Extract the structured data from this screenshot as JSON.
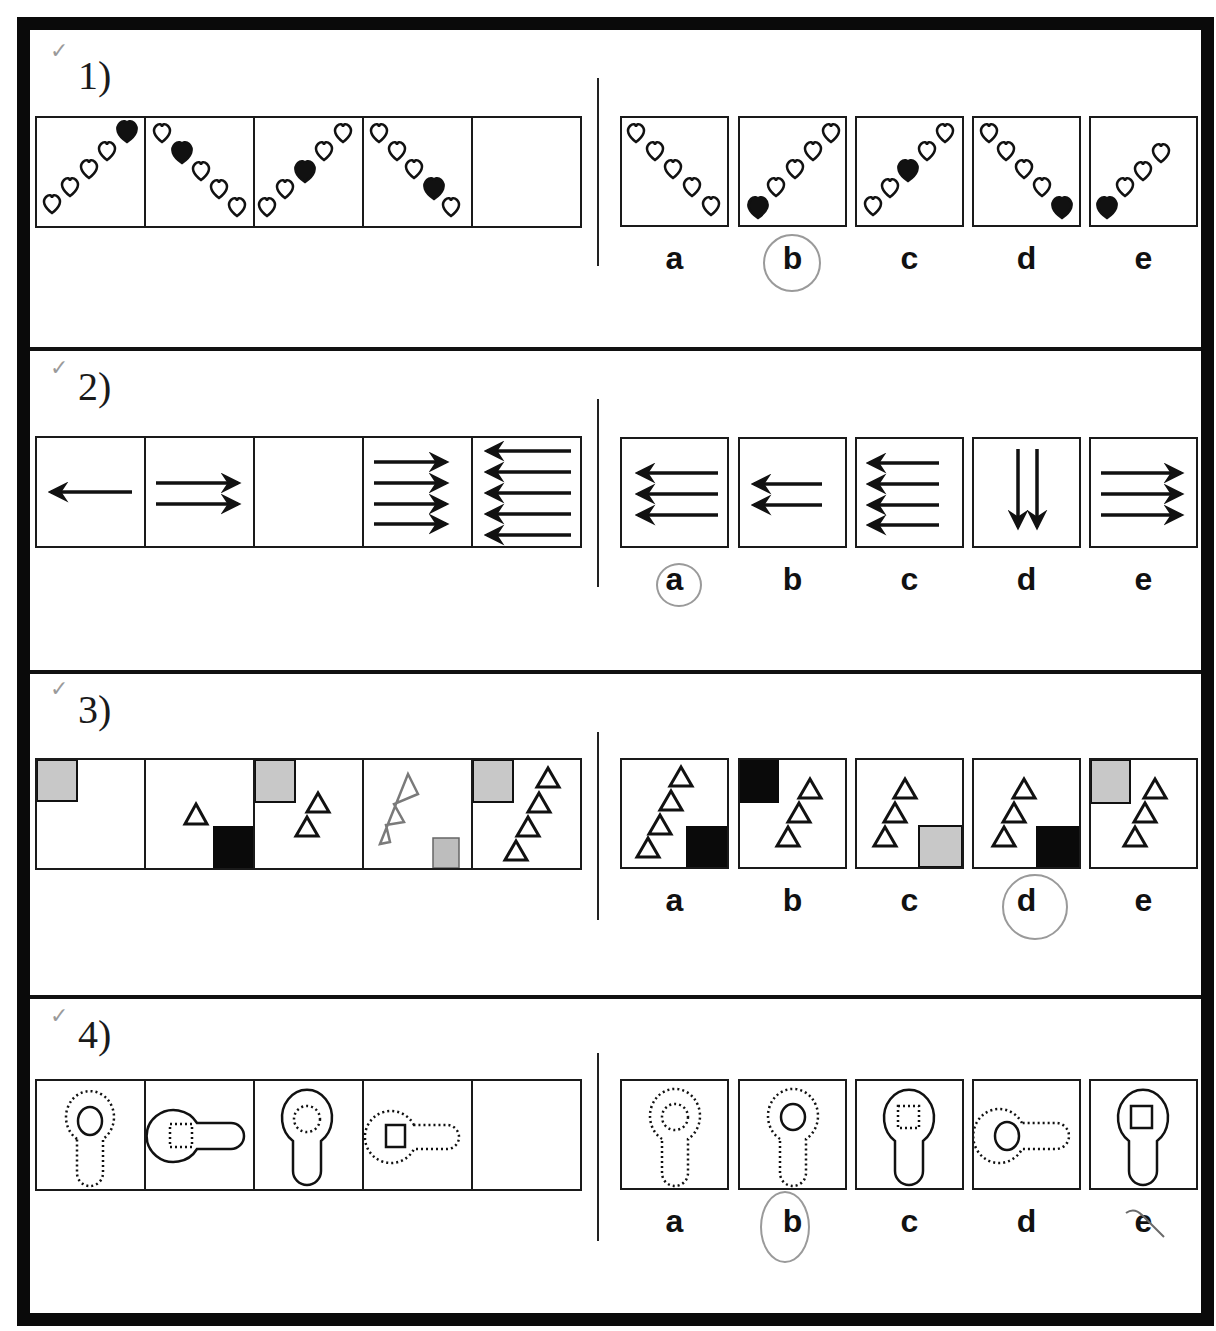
{
  "header_fragment": "p",
  "questions": [
    {
      "number": "1)",
      "checkmark": "✓",
      "sequence": [
        {
          "description": "5 hearts rising diagonal, top-right filled",
          "direction": "up",
          "filled_index": 4
        },
        {
          "description": "5 hearts falling diagonal, second filled",
          "direction": "down",
          "filled_index": 1
        },
        {
          "description": "5 hearts rising diagonal, middle filled",
          "direction": "up",
          "filled_index": 2
        },
        {
          "description": "5 hearts falling diagonal, fourth filled",
          "direction": "down",
          "filled_index": 3
        },
        {
          "description": "blank",
          "direction": "none",
          "filled_index": -1
        }
      ],
      "options": [
        {
          "label": "a",
          "direction": "down",
          "filled_index": -1,
          "count": 5
        },
        {
          "label": "b",
          "direction": "up",
          "filled_index": 0,
          "count": 5
        },
        {
          "label": "c",
          "direction": "up",
          "filled_index": 2,
          "count": 5
        },
        {
          "label": "d",
          "direction": "down",
          "filled_index": 4,
          "count": 5
        },
        {
          "label": "e",
          "direction": "up",
          "filled_index": 0,
          "count": 4
        }
      ],
      "circled": "b"
    },
    {
      "number": "2)",
      "checkmark": "✓",
      "sequence": [
        {
          "description": "1 arrow left",
          "count": 1,
          "dir": "left"
        },
        {
          "description": "2 arrows right",
          "count": 2,
          "dir": "right"
        },
        {
          "description": "blank",
          "count": 0,
          "dir": "none"
        },
        {
          "description": "4 arrows right",
          "count": 4,
          "dir": "right"
        },
        {
          "description": "5 arrows left",
          "count": 5,
          "dir": "left"
        }
      ],
      "options": [
        {
          "label": "a",
          "count": 3,
          "dir": "left"
        },
        {
          "label": "b",
          "count": 2,
          "dir": "left"
        },
        {
          "label": "c",
          "count": 4,
          "dir": "left"
        },
        {
          "label": "d",
          "count": 2,
          "dir": "down"
        },
        {
          "label": "e",
          "count": 3,
          "dir": "right"
        }
      ],
      "circled": "a"
    },
    {
      "number": "3)",
      "checkmark": "✓",
      "sequence": [
        {
          "description": "grey square top-left, 0 triangles"
        },
        {
          "description": "black square bottom-right, 1 triangle"
        },
        {
          "description": "grey square top-left, 2 triangles"
        },
        {
          "description": "hand-drawn 3 triangles, scribbled square bottom-right"
        },
        {
          "description": "grey square top-left, 4 triangles"
        }
      ],
      "options": [
        {
          "label": "a",
          "square": "black-bottom-right",
          "triangles": 4
        },
        {
          "label": "b",
          "square": "black-top-left",
          "triangles": 3
        },
        {
          "label": "c",
          "square": "grey-bottom-right",
          "triangles": 3
        },
        {
          "label": "d",
          "square": "black-bottom-right",
          "triangles": 3
        },
        {
          "label": "e",
          "square": "grey-top-left",
          "triangles": 3
        }
      ],
      "circled": "d"
    },
    {
      "number": "4)",
      "checkmark": "✓",
      "sequence": [
        {
          "description": "dotted keyhole vertical, solid circle inside"
        },
        {
          "description": "solid keyhole horizontal, dotted square inside"
        },
        {
          "description": "solid keyhole vertical, dotted circle inside"
        },
        {
          "description": "dotted keyhole horizontal, solid square inside"
        },
        {
          "description": "blank"
        }
      ],
      "options": [
        {
          "label": "a",
          "outline": "dotted",
          "orient": "vertical",
          "inner": "dotted-circle"
        },
        {
          "label": "b",
          "outline": "dotted",
          "orient": "vertical",
          "inner": "solid-circle"
        },
        {
          "label": "c",
          "outline": "solid",
          "orient": "vertical",
          "inner": "dotted-square"
        },
        {
          "label": "d",
          "outline": "dotted",
          "orient": "horizontal",
          "inner": "solid-circle"
        },
        {
          "label": "e",
          "outline": "solid",
          "orient": "vertical",
          "inner": "solid-square"
        }
      ],
      "circled": "b",
      "struck": "e"
    }
  ]
}
